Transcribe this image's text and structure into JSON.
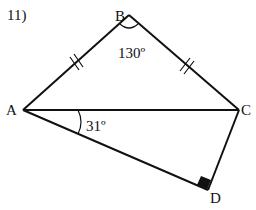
{
  "problem_number": "11)",
  "points": {
    "A": {
      "label": "A",
      "x": 23,
      "y": 110
    },
    "B": {
      "label": "B",
      "x": 129,
      "y": 15
    },
    "C": {
      "label": "C",
      "x": 239,
      "y": 110
    },
    "D": {
      "label": "D",
      "x": 208,
      "y": 190
    }
  },
  "angles": {
    "ABC": "130º",
    "CAD": "31º"
  },
  "marks": {
    "equal_sides": [
      "AB",
      "BC"
    ],
    "right_angle_at": "D"
  },
  "colors": {
    "stroke": "#111111",
    "background": "#ffffff"
  }
}
